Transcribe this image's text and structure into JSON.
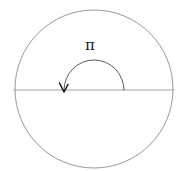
{
  "figure": {
    "name": "circle-with-pi-radian-arc",
    "canvas": {
      "width": 186,
      "height": 171,
      "background": "#ffffff"
    },
    "colors": {
      "circle_stroke": "#8c8c8c",
      "diameter_stroke": "#999999",
      "arc_stroke": "#5a5a5a",
      "arrowhead": "#111111",
      "label_text": "#1a1a1a"
    },
    "circle": {
      "label": "circle",
      "center_x": 94,
      "center_y": 89,
      "radius": 79,
      "stroke_width": 0.9
    },
    "diameter": {
      "label": "horizontal diameter",
      "x1": 14,
      "y1": 90,
      "x2": 174,
      "y2": 90,
      "stroke_width": 0.9
    },
    "angle_arc": {
      "label": "pi radian arc",
      "center_x": 94,
      "center_y": 90,
      "radius": 30,
      "start_angle_deg": 0,
      "end_angle_deg": 180,
      "direction": "counterclockwise",
      "stroke_width": 1.0,
      "has_arrowhead": true,
      "arrow_tip_x": 64,
      "arrow_tip_y": 92
    },
    "annotations": [
      {
        "name": "pi-label",
        "text": "π",
        "x": 91,
        "y": 45,
        "font_size": 15
      }
    ]
  },
  "chart_data": {
    "type": "diagram",
    "title": "",
    "elements": [
      {
        "shape": "circle",
        "cx": 94,
        "cy": 89,
        "r": 79
      },
      {
        "shape": "line",
        "x1": 14,
        "y1": 90,
        "x2": 174,
        "y2": 90
      },
      {
        "shape": "arc",
        "cx": 94,
        "cy": 90,
        "r": 30,
        "from_deg": 0,
        "to_deg": 180,
        "arrow": "end"
      }
    ],
    "labels": [
      {
        "text": "π",
        "x": 91,
        "y": 45,
        "meaning": "angle of pi radians (180 degrees)"
      }
    ]
  }
}
